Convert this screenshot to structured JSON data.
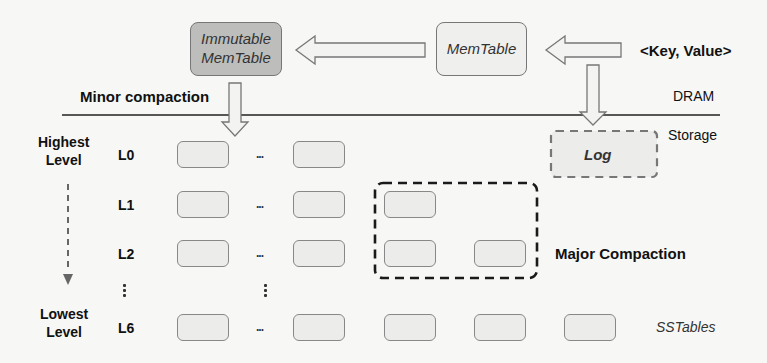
{
  "diagram": {
    "memory": {
      "immutable_memtable": "Immutable MemTable",
      "immutable_memtable_lines": [
        "Immutable",
        "MemTable"
      ],
      "memtable": "MemTable",
      "input": "<Key, Value>",
      "minor_compaction": "Minor compaction",
      "region_label": "DRAM"
    },
    "storage": {
      "region_label": "Storage",
      "log": "Log",
      "major_compaction": "Major Compaction",
      "sstables_label": "SSTables"
    },
    "levels": {
      "highest": [
        "Highest",
        "Level"
      ],
      "lowest": [
        "Lowest",
        "Level"
      ],
      "rows": [
        {
          "name": "L0",
          "sstable_count_visible": 2
        },
        {
          "name": "L1",
          "sstable_count_visible": 3
        },
        {
          "name": "L2",
          "sstable_count_visible": 4
        },
        {
          "name": "L6",
          "sstable_count_visible": 5
        }
      ],
      "ellipsis": "..."
    },
    "colors": {
      "immutable_fill": "#bdbdbb",
      "memtable_fill": "#efefed",
      "sstable_fill": "#ececea",
      "border": "#888888",
      "dashed": "#222222",
      "level_arrow": "#666666"
    }
  }
}
